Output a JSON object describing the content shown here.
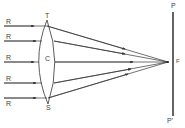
{
  "diagram": {
    "type": "optics-converging-lens",
    "rays": [
      {
        "label": "R",
        "y": 26,
        "lens_y": 26
      },
      {
        "label": "R",
        "y": 41,
        "lens_y": 41
      },
      {
        "label": "R",
        "y": 62,
        "lens_y": 62
      },
      {
        "label": "R",
        "y": 83,
        "lens_y": 83
      },
      {
        "label": "R",
        "y": 98,
        "lens_y": 98
      }
    ],
    "lens": {
      "top_label": "T",
      "center_label": "C",
      "bottom_label": "S"
    },
    "focus": {
      "label": "F"
    },
    "screen": {
      "top_label": "P",
      "bottom_label": "P'"
    },
    "colors": {
      "line": "#333333",
      "text": "#444444",
      "background": "#ffffff"
    }
  }
}
